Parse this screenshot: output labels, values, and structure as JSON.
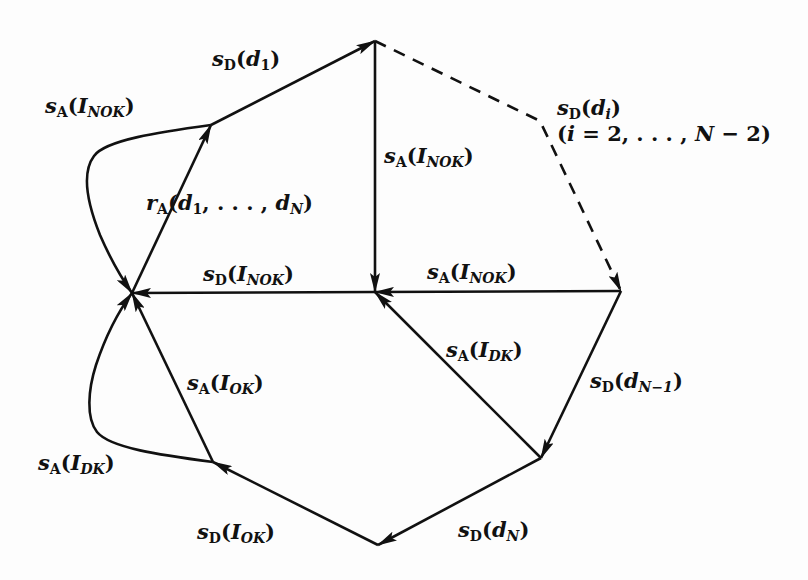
{
  "diagram": {
    "type": "state-transition-graph",
    "nodes": [
      {
        "id": "n_top",
        "x": 375,
        "y": 41
      },
      {
        "id": "n_upleft",
        "x": 211,
        "y": 125
      },
      {
        "id": "n_left",
        "x": 132,
        "y": 293
      },
      {
        "id": "n_center",
        "x": 375,
        "y": 292
      },
      {
        "id": "n_right",
        "x": 621,
        "y": 291
      },
      {
        "id": "n_lowright",
        "x": 541,
        "y": 458
      },
      {
        "id": "n_bottom",
        "x": 378,
        "y": 545
      },
      {
        "id": "n_lowleft",
        "x": 213,
        "y": 462
      }
    ],
    "edges": [
      {
        "from": "n_left",
        "to": "n_upleft",
        "label": "r_A(d_1, ..., d_N)"
      },
      {
        "from": "n_upleft",
        "to": "n_top",
        "label": "s_D(d_1)"
      },
      {
        "from": "n_upleft",
        "to": "n_left",
        "label": "s_A(I_NOK)",
        "curved": true
      },
      {
        "from": "n_top",
        "to": "n_right",
        "label": "s_D(d_i) (i = 2, ..., N - 2)",
        "dashed": true
      },
      {
        "from": "n_top",
        "to": "n_center",
        "label": "s_A(I_NOK)"
      },
      {
        "from": "n_right",
        "to": "n_center",
        "label": "s_A(I_NOK)"
      },
      {
        "from": "n_center",
        "to": "n_left",
        "label": "s_D(I_NOK)"
      },
      {
        "from": "n_right",
        "to": "n_lowright",
        "label": "s_D(d_N-1)"
      },
      {
        "from": "n_lowright",
        "to": "n_center",
        "label": "s_A(I_DK)"
      },
      {
        "from": "n_lowright",
        "to": "n_bottom",
        "label": "s_D(d_N)"
      },
      {
        "from": "n_bottom",
        "to": "n_lowleft",
        "label": "s_D(I_OK)"
      },
      {
        "from": "n_lowleft",
        "to": "n_left",
        "label": "s_A(I_OK)"
      },
      {
        "from": "n_lowleft",
        "to": "n_left",
        "label": "s_A(I_DK)",
        "curved": true
      }
    ]
  },
  "labels": {
    "sd_d1": {
      "base": "s",
      "sub": "D",
      "open": "(",
      "arg": "d",
      "argsub": "1",
      "close": ")"
    },
    "sa_inok_left": {
      "base": "s",
      "sub": "A",
      "open": "(",
      "arg": "I",
      "argsub": "NOK",
      "close": ")"
    },
    "ra": {
      "base": "r",
      "sub": "A",
      "open": "(",
      "arg": "d",
      "argsub": "1",
      "mid": ", . . . , ",
      "arg2": "d",
      "arg2sub": "N",
      "close": ")"
    },
    "sa_inok_vert": {
      "base": "s",
      "sub": "A",
      "open": "(",
      "arg": "I",
      "argsub": "NOK",
      "close": ")"
    },
    "sd_di": {
      "base": "s",
      "sub": "D",
      "open": "(",
      "arg": "d",
      "argsub": "i",
      "close": ")"
    },
    "range": {
      "text_open": "(",
      "var": "i",
      "eq": " = 2, . . . , ",
      "n": "N",
      "rest": " − 2)"
    },
    "sd_inok": {
      "base": "s",
      "sub": "D",
      "open": "(",
      "arg": "I",
      "argsub": "NOK",
      "close": ")"
    },
    "sa_inok_horiz": {
      "base": "s",
      "sub": "A",
      "open": "(",
      "arg": "I",
      "argsub": "NOK",
      "close": ")"
    },
    "sa_idk_center": {
      "base": "s",
      "sub": "A",
      "open": "(",
      "arg": "I",
      "argsub": "DK",
      "close": ")"
    },
    "sd_dn1": {
      "base": "s",
      "sub": "D",
      "open": "(",
      "arg": "d",
      "argsub": "N−1",
      "close": ")"
    },
    "sa_iok": {
      "base": "s",
      "sub": "A",
      "open": "(",
      "arg": "I",
      "argsub": "OK",
      "close": ")"
    },
    "sa_idk_left": {
      "base": "s",
      "sub": "A",
      "open": "(",
      "arg": "I",
      "argsub": "DK",
      "close": ")"
    },
    "sd_iok": {
      "base": "s",
      "sub": "D",
      "open": "(",
      "arg": "I",
      "argsub": "OK",
      "close": ")"
    },
    "sd_dn": {
      "base": "s",
      "sub": "D",
      "open": "(",
      "arg": "d",
      "argsub": "N",
      "close": ")"
    }
  },
  "colors": {
    "stroke": "#111111",
    "background": "#fdfdfd"
  }
}
